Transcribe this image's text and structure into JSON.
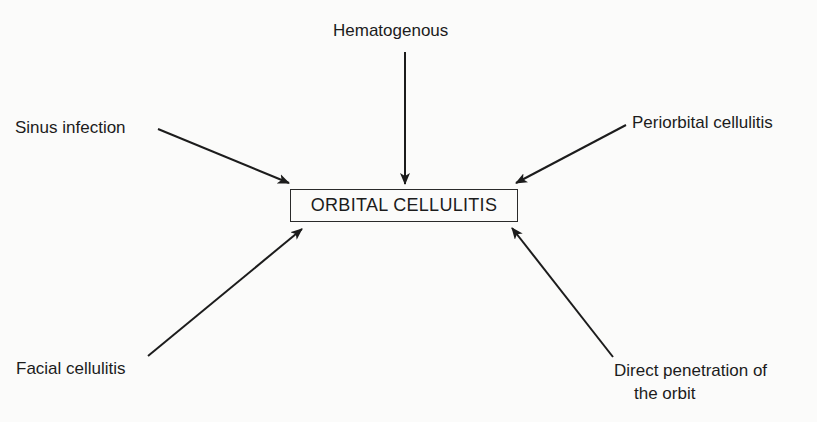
{
  "diagram": {
    "center": {
      "label": "ORBITAL CELLULITIS"
    },
    "sources": [
      {
        "id": "hematogenous",
        "label": "Hematogenous"
      },
      {
        "id": "sinus",
        "label": "Sinus infection"
      },
      {
        "id": "periorbital",
        "label": "Periorbital cellulitis"
      },
      {
        "id": "facial",
        "label": "Facial cellulitis"
      },
      {
        "id": "direct",
        "label_line1": "Direct penetration of",
        "label_line2": "the orbit"
      }
    ],
    "edges": [
      {
        "from": "Hematogenous",
        "to": "ORBITAL CELLULITIS"
      },
      {
        "from": "Sinus infection",
        "to": "ORBITAL CELLULITIS"
      },
      {
        "from": "Periorbital cellulitis",
        "to": "ORBITAL CELLULITIS"
      },
      {
        "from": "Facial cellulitis",
        "to": "ORBITAL CELLULITIS"
      },
      {
        "from": "Direct penetration of the orbit",
        "to": "ORBITAL CELLULITIS"
      }
    ],
    "colors": {
      "ink": "#1c1c1c",
      "background": "#fbfbfa"
    }
  }
}
